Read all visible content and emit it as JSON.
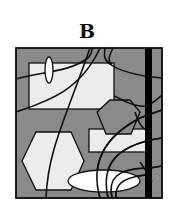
{
  "panel": {
    "label": "B",
    "colors": {
      "background": "#8a8a8a",
      "shape_fill": "#ececec",
      "ellipse_fill": "#ffffff",
      "stroke": "#111111",
      "bar": "#000000"
    },
    "frame": {
      "x": 16,
      "y": 48,
      "w": 146,
      "h": 150
    },
    "bar": {
      "x": 145,
      "y": 48,
      "w": 7,
      "h": 150
    },
    "rects": [
      {
        "name": "top-rect",
        "x": 29,
        "y": 63,
        "w": 85,
        "h": 46
      },
      {
        "name": "mid-right-rect",
        "x": 89,
        "y": 129,
        "w": 59,
        "h": 23
      }
    ],
    "hexagons": [
      {
        "name": "left-hexagon",
        "points": "22,161 36,132 71,132 84,161 71,190 36,190"
      },
      {
        "name": "mid-hexagon",
        "points": "97,112 110,100 130,100 140,112 131,134 106,134"
      }
    ],
    "ellipses": [
      {
        "name": "small-vertical-ellipse",
        "cx": 49,
        "cy": 70,
        "rx": 4,
        "ry": 13
      },
      {
        "name": "bottom-ellipse",
        "cx": 104,
        "cy": 181,
        "rx": 36,
        "ry": 11
      }
    ],
    "curves": [
      "M16,79 C40,72 70,72 88,58 C92,54 92,50 92,48",
      "M16,112 C45,102 80,92 100,48",
      "M46,198 C48,150 65,120 90,48",
      "M105,48 C104,56 104,60 110,64 C120,72 140,76 162,78",
      "M113,48 C108,58 108,62 112,64",
      "M114,96 C120,98 126,104 140,106 C148,108 156,100 162,95",
      "M100,198 C92,170 98,140 140,118 C148,115 156,112 162,110",
      "M108,198 C102,170 110,150 150,140 L162,138",
      "M112,198 C108,180 115,168 150,168 L162,166",
      "M116,198 C115,186 120,178 145,175",
      "M135,112 C138,122 142,128 146,130",
      "M140,162 C146,170 150,178 152,182"
    ]
  }
}
